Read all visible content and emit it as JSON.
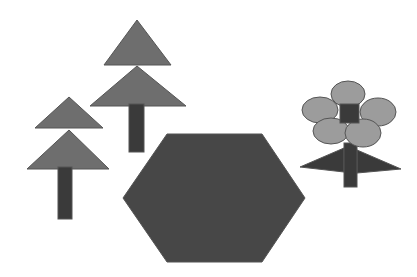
{
  "canvas": {
    "width": 417,
    "height": 277,
    "background_color": "#ffffff",
    "title": "Abstract Shape Scene"
  },
  "palette": {
    "foliage_gray": "#6e6e6e",
    "petal_gray": "#9c9c9c",
    "dark_gray": "#3a3a3a",
    "hexagon_gray": "#474747",
    "outline_gray": "#555555",
    "background": "#ffffff"
  },
  "objects": [
    {
      "id": "small-tree",
      "label": "Small Tree",
      "parts": [
        {
          "id": "small-tree-top-triangle",
          "label": "Top Foliage Triangle",
          "shape": "triangle",
          "color": "#6e6e6e",
          "points": "69,97 103,128 35,128"
        },
        {
          "id": "small-tree-bottom-triangle",
          "label": "Bottom Foliage Triangle",
          "shape": "triangle",
          "color": "#6e6e6e",
          "points": "69,130 109,169 27,169"
        },
        {
          "id": "small-tree-trunk",
          "label": "Trunk",
          "shape": "rect",
          "color": "#3a3a3a",
          "x": 58,
          "y": 167,
          "width": 14,
          "height": 52
        }
      ]
    },
    {
      "id": "large-tree",
      "label": "Large Tree",
      "parts": [
        {
          "id": "large-tree-top-triangle",
          "label": "Top Foliage Triangle",
          "shape": "triangle",
          "color": "#6e6e6e",
          "points": "137,20 171,65 104,65"
        },
        {
          "id": "large-tree-bottom-triangle",
          "label": "Bottom Foliage Triangle",
          "shape": "triangle",
          "color": "#6e6e6e",
          "points": "137,66 186,106 90,106"
        },
        {
          "id": "large-tree-trunk",
          "label": "Trunk",
          "shape": "rect",
          "color": "#3a3a3a",
          "x": 129,
          "y": 104,
          "width": 15,
          "height": 48
        }
      ]
    },
    {
      "id": "hexagon",
      "label": "Hexagon",
      "parts": [
        {
          "id": "hexagon-body",
          "label": "Hexagon Body",
          "shape": "hexagon",
          "color": "#474747",
          "points": "167,134 262,134 305,198 262,262 167,262 123,198"
        }
      ]
    },
    {
      "id": "flower",
      "label": "Flower",
      "parts": [
        {
          "id": "flower-petal-top",
          "label": "Top Petal",
          "shape": "ellipse",
          "color": "#9c9c9c",
          "cx": 348,
          "cy": 94,
          "rx": 17,
          "ry": 13
        },
        {
          "id": "flower-petal-left",
          "label": "Left Petal",
          "shape": "ellipse",
          "color": "#9c9c9c",
          "cx": 320,
          "cy": 110,
          "rx": 18,
          "ry": 13
        },
        {
          "id": "flower-petal-right",
          "label": "Right Petal",
          "shape": "ellipse",
          "color": "#9c9c9c",
          "cx": 378,
          "cy": 112,
          "rx": 18,
          "ry": 14
        },
        {
          "id": "flower-petal-bottom-left",
          "label": "Bottom Left Petal",
          "shape": "ellipse",
          "color": "#9c9c9c",
          "cx": 331,
          "cy": 131,
          "rx": 18,
          "ry": 13
        },
        {
          "id": "flower-petal-bottom-right",
          "label": "Bottom Right Petal",
          "shape": "ellipse",
          "color": "#9c9c9c",
          "cx": 363,
          "cy": 133,
          "rx": 18,
          "ry": 14
        },
        {
          "id": "flower-center-square",
          "label": "Flower Center Square",
          "shape": "rect",
          "color": "#3a3a3a",
          "x": 340,
          "y": 104,
          "width": 19,
          "height": 19
        },
        {
          "id": "flower-stem",
          "label": "Stem",
          "shape": "rect",
          "color": "#3a3a3a",
          "x": 344,
          "y": 143,
          "width": 13,
          "height": 44
        },
        {
          "id": "flower-leaf-left",
          "label": "Left Leaf",
          "shape": "triangle",
          "color": "#3a3a3a",
          "points": "344,148 344,172 300,167"
        },
        {
          "id": "flower-leaf-right",
          "label": "Right Leaf",
          "shape": "triangle",
          "color": "#3a3a3a",
          "points": "357,150 357,173 401,169"
        }
      ]
    }
  ]
}
